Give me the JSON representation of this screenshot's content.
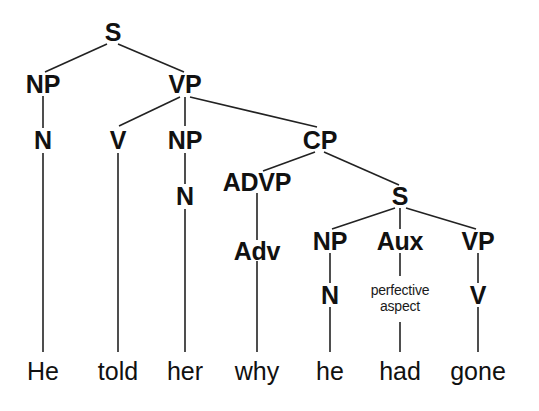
{
  "figure": {
    "sentence": "He told her why he had gone",
    "line_color": "#222222",
    "text_color": "#111111",
    "background": "#ffffff"
  },
  "nodes": {
    "s_top": "S",
    "np_subj": "NP",
    "n_subj": "N",
    "vp_main": "VP",
    "v_main": "V",
    "np_obj": "NP",
    "n_obj": "N",
    "cp": "CP",
    "advp": "ADVP",
    "adv": "Adv",
    "s_embedded": "S",
    "np_emb": "NP",
    "n_emb": "N",
    "aux": "Aux",
    "aux_feature_line1": "perfective",
    "aux_feature_line2": "aspect",
    "vp_emb": "VP",
    "v_emb": "V"
  },
  "terminals": {
    "he_subj": "He",
    "told": "told",
    "her": "her",
    "why": "why",
    "he_emb": "he",
    "had": "had",
    "gone": "gone"
  }
}
